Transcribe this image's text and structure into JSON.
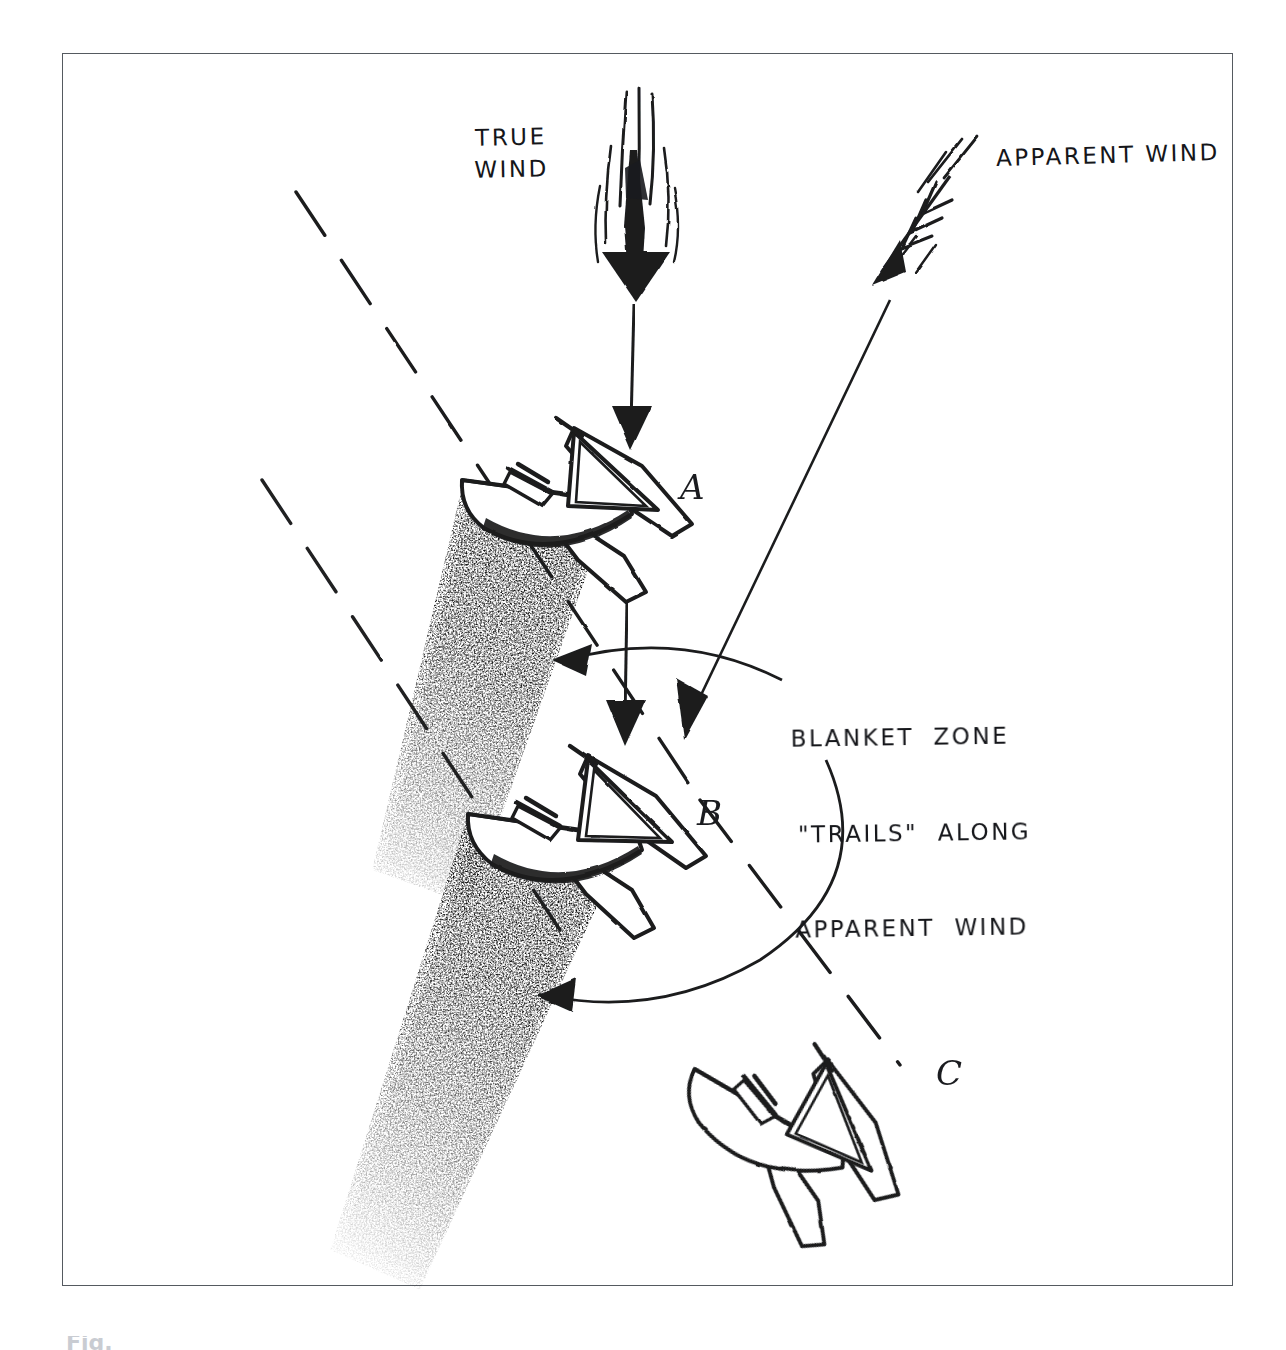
{
  "figure": {
    "kind": "hand-drawn sailing tactics diagram",
    "background_color": "#ffffff",
    "ink_color": "#1a1b1f",
    "frame_color": "#555a60"
  },
  "labels": {
    "true_wind": "TRUE\nWIND",
    "apparent_wind": "APPARENT WIND",
    "blanket_line1": "BLANKET  ZONE",
    "blanket_line2": "\"TRAILS\"  ALONG",
    "blanket_line3": "APPARENT  WIND"
  },
  "boats": [
    {
      "id": "A",
      "letter": "A",
      "has_blanket_zone": true
    },
    {
      "id": "B",
      "letter": "B",
      "has_blanket_zone": true
    },
    {
      "id": "C",
      "letter": "C",
      "has_blanket_zone": false
    }
  ],
  "arrows": {
    "true_wind_direction": "downward (vertical)",
    "apparent_wind_direction": "down and to the left (diagonal)",
    "leader_top_target": "blanket zone of boat A",
    "leader_bottom_target": "blanket zone of boat B"
  },
  "caption": {
    "partial_text": "Fig."
  }
}
